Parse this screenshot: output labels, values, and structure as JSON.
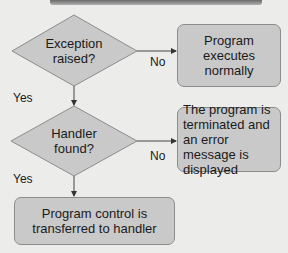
{
  "diagram": {
    "type": "flowchart",
    "decisions": [
      {
        "id": "d1",
        "label": "Exception raised?"
      },
      {
        "id": "d2",
        "label": "Handler found?"
      }
    ],
    "process_boxes": [
      {
        "id": "b1",
        "label": "Program executes normally"
      },
      {
        "id": "b2",
        "label": "The program is terminated and an error message is displayed"
      },
      {
        "id": "b3",
        "label": "Program control is transferred to handler"
      }
    ],
    "edges": [
      {
        "from": "d1",
        "to": "b1",
        "label": "No"
      },
      {
        "from": "d1",
        "to": "d2",
        "label": "Yes"
      },
      {
        "from": "d2",
        "to": "b2",
        "label": "No"
      },
      {
        "from": "d2",
        "to": "b3",
        "label": "Yes"
      }
    ]
  }
}
